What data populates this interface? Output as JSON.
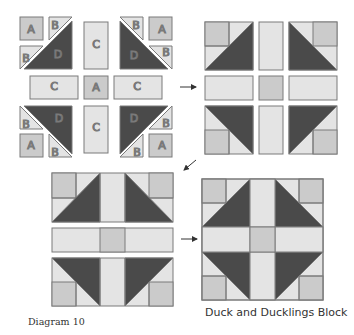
{
  "figure": {
    "label": "Diagram 10",
    "caption": "Duck and Ducklings Block",
    "colors": {
      "light": "#e4e4e4",
      "medium": "#cbcbcb",
      "dark": "#4a4a4a",
      "stroke": "#7a7a7a",
      "arrow": "#333333"
    }
  },
  "pieces": {
    "A": "A",
    "B": "B",
    "C": "C",
    "D": "D"
  },
  "steps": [
    {
      "name": "step-1-exploded-pieces",
      "description": "Pieces A, B, C, D laid out"
    },
    {
      "name": "step-2-units-assembled",
      "description": "Corner units and C/A rows joined"
    },
    {
      "name": "step-3-rows-assembled",
      "description": "Three rows assembled"
    },
    {
      "name": "step-4-finished-block",
      "description": "Finished block"
    }
  ],
  "arrows": [
    {
      "name": "arrow-step1-to-step2",
      "direction": "right"
    },
    {
      "name": "arrow-step2-to-step3",
      "direction": "down-left"
    },
    {
      "name": "arrow-step3-to-step4",
      "direction": "right"
    }
  ]
}
